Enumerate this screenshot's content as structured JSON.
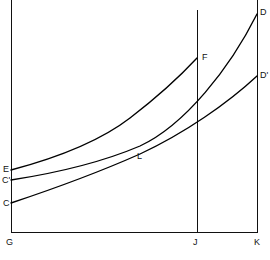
{
  "figure": {
    "background_color": "#ffffff",
    "line_color": "#111111",
    "width": 270,
    "height": 260
  },
  "axes": {
    "origin_label": "G",
    "x_axis_name": "horizontal-axis",
    "y_axis_name": "vertical-axis",
    "x_start_px": 11,
    "x_end_px": 257,
    "y_top_px": 0,
    "y_base_px": 232
  },
  "reference_lines": [
    {
      "label": "J",
      "x_px": 197,
      "top_px": 10,
      "bottom_px": 232
    },
    {
      "label": "K",
      "x_px": 257,
      "top_px": 0,
      "bottom_px": 232
    }
  ],
  "labels": {
    "origin": "G",
    "j_mark": "J",
    "k_mark": "K",
    "curve_e_start": "E",
    "curve_cprime_start": "C'",
    "curve_c_start": "C",
    "curve_f_end": "F",
    "curve_d_end": "D",
    "curve_dprime_end": "D'",
    "intersection": "L"
  },
  "chart_data": {
    "type": "line",
    "title": "",
    "xlabel": "",
    "ylabel": "",
    "grid": false,
    "legend": "none",
    "axis_origin": "G",
    "x_marks": [
      {
        "label": "G",
        "x": 11
      },
      {
        "label": "J",
        "x": 197
      },
      {
        "label": "K",
        "x": 257
      }
    ],
    "xlim": [
      11,
      257
    ],
    "ylim": [
      232,
      0
    ],
    "annotations": [
      {
        "text": "L",
        "x": 141,
        "y": 156,
        "note": "common intersection point of all three curves"
      }
    ],
    "series": [
      {
        "name": "EF",
        "start_label": "E",
        "end_label": "F",
        "path": "M 11 170 C 45 161, 95 145, 130 118 C 160 95, 184 72, 197 58",
        "points": [
          [
            11,
            170
          ],
          [
            40,
            163
          ],
          [
            70,
            154
          ],
          [
            100,
            140
          ],
          [
            130,
            118
          ],
          [
            160,
            93
          ],
          [
            180,
            72
          ],
          [
            197,
            58
          ]
        ]
      },
      {
        "name": "CD",
        "start_label": "C'",
        "end_label": "D",
        "path": "M 11 180 C 50 174, 100 163, 140 146 C 185 125, 230 68, 257 14",
        "points": [
          [
            11,
            180
          ],
          [
            45,
            175
          ],
          [
            80,
            168
          ],
          [
            115,
            157
          ],
          [
            140,
            146
          ],
          [
            175,
            124
          ],
          [
            215,
            80
          ],
          [
            257,
            14
          ]
        ]
      },
      {
        "name": "CDprime",
        "start_label": "C",
        "end_label": "D'",
        "path": "M 11 203 C 50 190, 95 174, 140 154 C 185 133, 228 103, 257 76",
        "points": [
          [
            11,
            203
          ],
          [
            45,
            191
          ],
          [
            80,
            179
          ],
          [
            115,
            165
          ],
          [
            140,
            154
          ],
          [
            180,
            135
          ],
          [
            220,
            112
          ],
          [
            257,
            76
          ]
        ]
      }
    ]
  }
}
